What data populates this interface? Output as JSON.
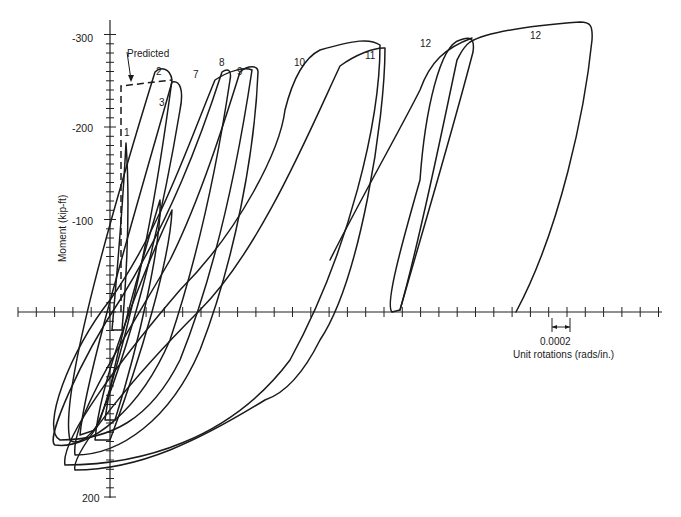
{
  "chart_data": {
    "type": "line",
    "title": "",
    "xlabel": "Unit rotations (rads/in.)",
    "ylabel": "Moment (kip-ft)",
    "y_ticks": [
      {
        "value": -300,
        "label": "-300"
      },
      {
        "value": -200,
        "label": "-200"
      },
      {
        "value": -100,
        "label": "-100"
      },
      {
        "value": 200,
        "label": "200"
      }
    ],
    "ylim": [
      200,
      -330
    ],
    "y_minor_step": 10,
    "x_tick_step": 0.0001,
    "x_scale_indicator": "0.0002",
    "legend": [],
    "predicted": {
      "label": "Predicted",
      "points": [
        [
          1e-05,
          0
        ],
        [
          1e-05,
          -247
        ],
        [
          0.00036,
          -258
        ]
      ]
    },
    "cycle_labels": [
      {
        "label": "1",
        "x": 0.0001,
        "y": -196
      },
      {
        "label": "2",
        "x": 0.0003,
        "y": -265
      },
      {
        "label": "3",
        "x": 0.00034,
        "y": -223
      },
      {
        "label": "7",
        "x": 0.0006,
        "y": -260
      },
      {
        "label": "8",
        "x": 0.00082,
        "y": -270
      },
      {
        "label": "9",
        "x": 0.00093,
        "y": -262
      },
      {
        "label": "10",
        "x": 0.0014,
        "y": -283
      },
      {
        "label": "11",
        "x": 0.0021,
        "y": -284
      },
      {
        "label": "12",
        "x": 0.0026,
        "y": -300
      },
      {
        "label": "12",
        "x": 0.0033,
        "y": -305
      }
    ],
    "series": [
      {
        "name": "cycle 1",
        "peak": [
          0.0001,
          -186
        ]
      },
      {
        "name": "cycle 2",
        "peak": [
          0.00032,
          -265
        ]
      },
      {
        "name": "cycle 7",
        "peak": [
          0.00065,
          -265
        ]
      },
      {
        "name": "cycle 8",
        "peak": [
          0.00083,
          -268
        ]
      },
      {
        "name": "cycle 9",
        "peak": [
          0.00097,
          -270
        ]
      },
      {
        "name": "cycle 10",
        "peak": [
          0.0018,
          -290
        ]
      },
      {
        "name": "cycle 11",
        "peak": [
          0.0022,
          -292
        ]
      },
      {
        "name": "cycle 12a",
        "peak": [
          0.0025,
          -305
        ]
      },
      {
        "name": "cycle 12b",
        "peak": [
          0.0035,
          -315
        ]
      }
    ],
    "grid": false
  },
  "labels": {
    "ylabel": "Moment (kip-ft)",
    "xlabel": "Unit rotations (rads/in.)",
    "scale": "0.0002",
    "predicted": "Predicted",
    "y_m300": "-300",
    "y_m200": "-200",
    "y_m100": "-100",
    "y_200": "200",
    "c1": "1",
    "c2": "2",
    "c3": "3",
    "c7": "7",
    "c8": "8",
    "c9": "9",
    "c10": "10",
    "c11": "11",
    "c12a": "12",
    "c12b": "12"
  }
}
